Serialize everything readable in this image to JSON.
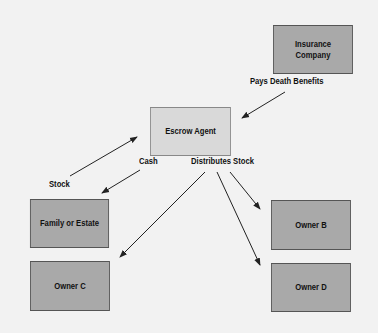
{
  "diagram": {
    "nodes": {
      "insurance": "Insurance Company",
      "escrow": "Escrow Agent",
      "family": "Family or Estate",
      "owner_b": "Owner B",
      "owner_c": "Owner C",
      "owner_d": "Owner D"
    },
    "edge_labels": {
      "pays": "Pays Death Benefits",
      "cash": "Cash",
      "distributes": "Distributes Stock",
      "stock": "Stock"
    },
    "colors": {
      "background": "#f2f2f2",
      "dark_box": "#a9a9a9",
      "light_box": "#d9d9d9",
      "line": "#222222"
    }
  }
}
